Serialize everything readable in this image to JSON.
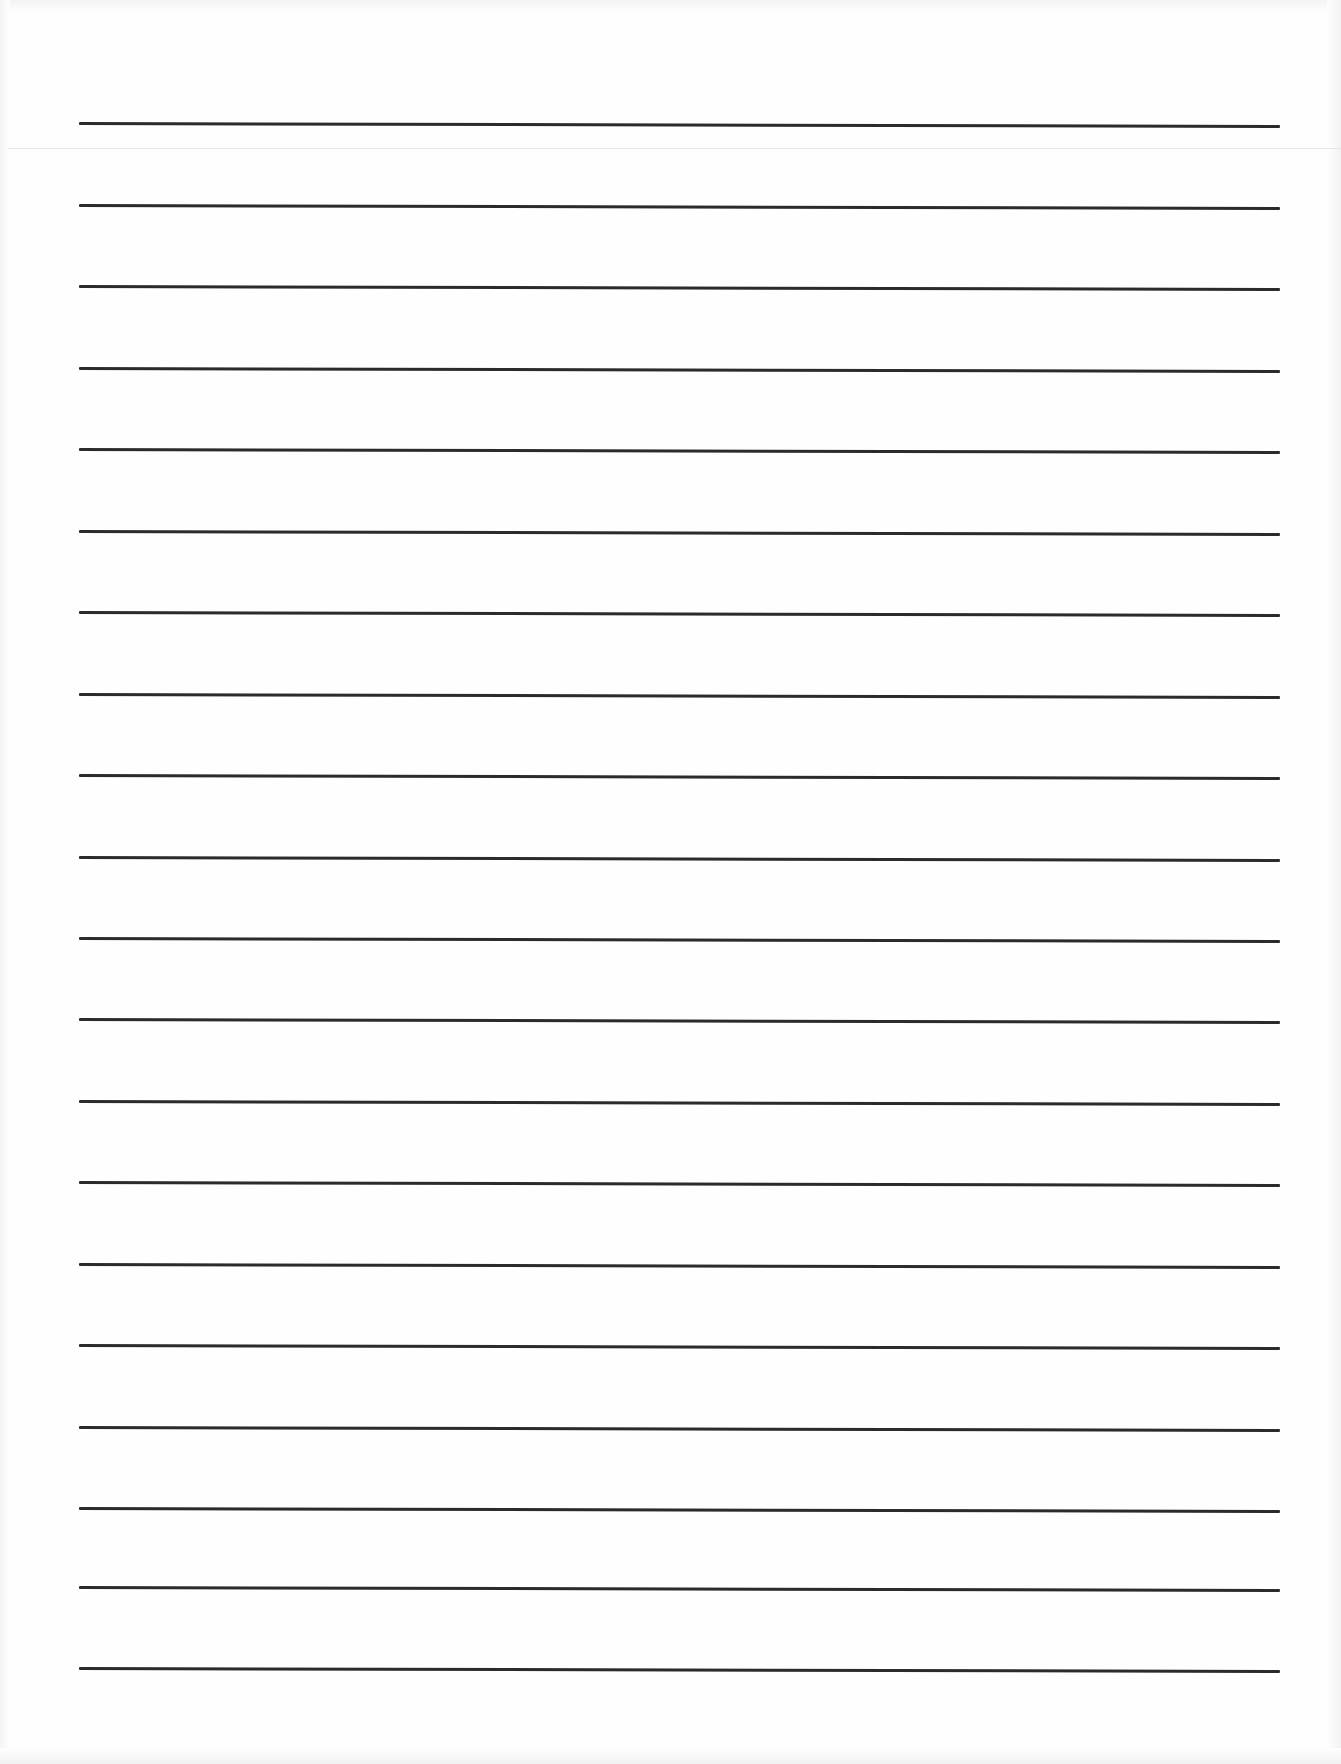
{
  "document": {
    "type": "lined-paper",
    "background_color": "#fefefe",
    "rule_color": "#2b2b2b",
    "rule_count": 20,
    "rule_left_x": 79,
    "rule_right_x": 1280,
    "rule_spacing_px": 81.5,
    "rule_tilt_px": 3,
    "fold_line_y": 148,
    "rules_y": [
      122,
      204,
      285,
      367,
      448,
      530,
      611,
      693,
      774,
      856,
      937,
      1018,
      1100,
      1181,
      1263,
      1344,
      1426,
      1507,
      1586,
      1667
    ]
  }
}
